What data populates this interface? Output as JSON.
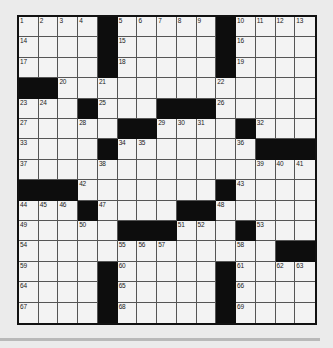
{
  "puzzle": {
    "rows": 15,
    "cols": 15,
    "colors": {
      "background": "#ebebeb",
      "cell": "#f3f3f3",
      "block": "#0d0d0d",
      "gridline": "#555555",
      "rule": "#b9b9b9"
    },
    "grid": [
      [
        "1",
        "2",
        "3",
        "4",
        "#",
        "5",
        "6",
        "7",
        "8",
        "9",
        "#",
        "10",
        "11",
        "12",
        "13"
      ],
      [
        "14",
        "",
        "",
        "",
        "#",
        "15",
        "",
        "",
        "",
        "",
        "#",
        "16",
        "",
        "",
        ""
      ],
      [
        "17",
        "",
        "",
        "",
        "#",
        "18",
        "",
        "",
        "",
        "",
        "#",
        "19",
        "",
        "",
        ""
      ],
      [
        "#",
        "#",
        "20",
        "",
        "21",
        "",
        "",
        "",
        "",
        "",
        "22",
        "",
        "",
        "",
        ""
      ],
      [
        "23",
        "24",
        "",
        "#",
        "25",
        "",
        "",
        "#",
        "#",
        "#",
        "26",
        "",
        "",
        "",
        ""
      ],
      [
        "27",
        "",
        "",
        "28",
        "",
        "#",
        "#",
        "29",
        "30",
        "31",
        "",
        "#",
        "32",
        "",
        ""
      ],
      [
        "33",
        "",
        "",
        "",
        "#",
        "34",
        "35",
        "",
        "",
        "",
        "",
        "36",
        "#",
        "#",
        "#"
      ],
      [
        "37",
        "",
        "",
        "",
        "38",
        "",
        "",
        "",
        "",
        "",
        "",
        "",
        "39",
        "40",
        "41"
      ],
      [
        "#",
        "#",
        "#",
        "42",
        "",
        "",
        "",
        "",
        "",
        "",
        "#",
        "43",
        "",
        "",
        ""
      ],
      [
        "44",
        "45",
        "46",
        "#",
        "47",
        "",
        "",
        "",
        "#",
        "#",
        "48",
        "",
        "",
        "",
        ""
      ],
      [
        "49",
        "",
        "",
        "50",
        "",
        "#",
        "#",
        "#",
        "51",
        "52",
        "",
        "#",
        "53",
        "",
        ""
      ],
      [
        "54",
        "",
        "",
        "",
        "",
        "55",
        "56",
        "57",
        "",
        "",
        "",
        "58",
        "",
        "#",
        "#"
      ],
      [
        "59",
        "",
        "",
        "",
        "#",
        "60",
        "",
        "",
        "",
        "",
        "#",
        "61",
        "",
        "62",
        "63"
      ],
      [
        "64",
        "",
        "",
        "",
        "#",
        "65",
        "",
        "",
        "",
        "",
        "#",
        "66",
        "",
        "",
        ""
      ],
      [
        "67",
        "",
        "",
        "",
        "#",
        "68",
        "",
        "",
        "",
        "",
        "#",
        "69",
        "",
        "",
        ""
      ]
    ]
  }
}
